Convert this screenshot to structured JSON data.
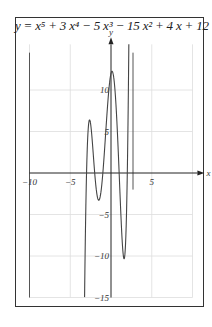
{
  "chart_data": {
    "type": "line",
    "title_display": "y = x⁵ + 3 x⁴ − 5 x³ − 15 x² + 4 x + 12",
    "xlabel": "x",
    "ylabel": "y",
    "xlim": [
      -10,
      10
    ],
    "ylim": [
      -15,
      15
    ],
    "x_ticks": [
      -10,
      -5,
      5
    ],
    "x_tick_labels": [
      "−10",
      "−5",
      "5"
    ],
    "y_ticks": [
      10,
      5,
      -5,
      -10,
      -15
    ],
    "y_tick_labels": [
      "10",
      "5",
      "−5",
      "−10",
      "−15"
    ],
    "grid": true,
    "coefficients": [
      1,
      3,
      -5,
      -15,
      4,
      12
    ],
    "roots": [
      -3,
      -2,
      -1,
      1,
      2
    ],
    "key_points": [
      {
        "label": "local max",
        "x": -2.6,
        "y": 6.4
      },
      {
        "label": "local min",
        "x": -1.6,
        "y": -3.3
      },
      {
        "label": "y-intercept / local max",
        "x": 0.15,
        "y": 12.3
      },
      {
        "label": "local min",
        "x": 1.55,
        "y": -10.3
      }
    ],
    "series": [
      {
        "name": "y = x^5 + 3x^4 - 5x^3 - 15x^2 + 4x + 12",
        "color": "#444444"
      }
    ]
  },
  "colors": {
    "curve": "#444444",
    "axis": "#222222",
    "grid": "#dddddd",
    "frame": "#333333"
  }
}
